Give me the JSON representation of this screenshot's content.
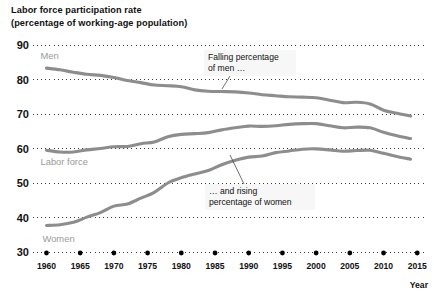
{
  "title": {
    "line1": "Labor force participation rate",
    "line2": "(percentage of working-age population)"
  },
  "chart_data": {
    "type": "line",
    "title": "Labor force participation rate (percentage of working-age population)",
    "xlabel": "Year",
    "ylabel": "",
    "xlim": [
      1958,
      2016
    ],
    "ylim": [
      30,
      90
    ],
    "grid": true,
    "grid_style": "dotted-horizontal",
    "legend": "inline-labels",
    "ytick_labels": [
      "30",
      "40",
      "50",
      "60",
      "70",
      "80",
      "90"
    ],
    "ytick_values": [
      30,
      40,
      50,
      60,
      70,
      80,
      90
    ],
    "xtick_labels": [
      "1960",
      "1965",
      "1970",
      "1975",
      "1980",
      "1985",
      "1990",
      "1995",
      "2000",
      "2005",
      "2010",
      "2015"
    ],
    "xtick_values": [
      1960,
      1965,
      1970,
      1975,
      1980,
      1985,
      1990,
      1995,
      2000,
      2005,
      2010,
      2015
    ],
    "line_color": "#8d8d8d",
    "series": [
      {
        "name": "Men",
        "label": "Men",
        "x": [
          1960,
          1962,
          1964,
          1966,
          1968,
          1970,
          1972,
          1974,
          1976,
          1978,
          1980,
          1982,
          1984,
          1986,
          1988,
          1990,
          1992,
          1994,
          1996,
          1998,
          2000,
          2002,
          2004,
          2006,
          2008,
          2010,
          2012,
          2014
        ],
        "values": [
          83.3,
          82.8,
          82.1,
          81.5,
          81.2,
          80.6,
          79.7,
          79.1,
          78.4,
          78.2,
          77.9,
          77.0,
          76.6,
          76.5,
          76.4,
          76.1,
          75.6,
          75.3,
          75.0,
          74.9,
          74.7,
          74.0,
          73.3,
          73.4,
          72.9,
          71.1,
          70.2,
          69.4
        ]
      },
      {
        "name": "Labor force",
        "label": "Labor force",
        "x": [
          1960,
          1962,
          1964,
          1966,
          1968,
          1970,
          1972,
          1974,
          1976,
          1978,
          1980,
          1982,
          1984,
          1986,
          1988,
          1990,
          1992,
          1994,
          1996,
          1998,
          2000,
          2002,
          2004,
          2006,
          2008,
          2010,
          2012,
          2014
        ],
        "values": [
          59.5,
          59.0,
          59.0,
          59.6,
          60.0,
          60.5,
          60.6,
          61.4,
          61.9,
          63.4,
          64.1,
          64.3,
          64.6,
          65.4,
          66.0,
          66.5,
          66.4,
          66.6,
          67.0,
          67.2,
          67.2,
          66.6,
          66.0,
          66.2,
          66.0,
          64.7,
          63.7,
          62.9
        ]
      },
      {
        "name": "Women",
        "label": "Women",
        "x": [
          1960,
          1962,
          1964,
          1966,
          1968,
          1970,
          1972,
          1974,
          1976,
          1978,
          1980,
          1982,
          1984,
          1986,
          1988,
          1990,
          1992,
          1994,
          1996,
          1998,
          2000,
          2002,
          2004,
          2006,
          2008,
          2010,
          2012,
          2014
        ],
        "values": [
          37.7,
          37.9,
          38.6,
          40.1,
          41.4,
          43.3,
          43.9,
          45.6,
          47.3,
          50.0,
          51.5,
          52.6,
          53.6,
          55.3,
          56.6,
          57.5,
          57.8,
          58.8,
          59.3,
          59.8,
          59.9,
          59.6,
          59.2,
          59.4,
          59.5,
          58.6,
          57.7,
          56.9
        ]
      }
    ],
    "annotations": [
      {
        "id": "falling-men",
        "line1": "Falling percentage",
        "line2": "of men …",
        "points_to": "Men"
      },
      {
        "id": "rising-women",
        "line1": "… and rising",
        "line2": "percentage of women",
        "points_to": "Women"
      }
    ]
  }
}
